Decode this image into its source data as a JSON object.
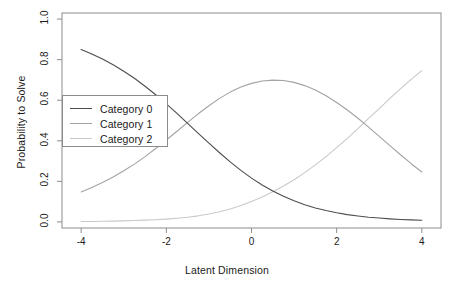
{
  "chart_data": {
    "type": "line",
    "title": "",
    "xlabel": "Latent Dimension",
    "ylabel": "Probability to Solve",
    "xlim": [
      -4.45,
      4.45
    ],
    "ylim": [
      -0.03,
      1.03
    ],
    "xticks": [
      "-4",
      "-2",
      "0",
      "2",
      "4"
    ],
    "xtick_values": [
      -4,
      -2,
      0,
      2,
      4
    ],
    "yticks": [
      "0.0",
      "0.2",
      "0.4",
      "0.6",
      "0.8",
      "1.0"
    ],
    "ytick_values": [
      0.0,
      0.2,
      0.4,
      0.6,
      0.8,
      1.0
    ],
    "grid": false,
    "legend_position": "center-left",
    "frame": true,
    "x": [
      -4.0,
      -3.75,
      -3.5,
      -3.25,
      -3.0,
      -2.75,
      -2.5,
      -2.25,
      -2.0,
      -1.75,
      -1.5,
      -1.25,
      -1.0,
      -0.75,
      -0.5,
      -0.25,
      0.0,
      0.25,
      0.5,
      0.75,
      1.0,
      1.25,
      1.5,
      1.75,
      2.0,
      2.25,
      2.5,
      2.75,
      3.0,
      3.25,
      3.5,
      3.75,
      4.0
    ],
    "series": [
      {
        "name": "Category 0",
        "color": "#4d4d4d",
        "values": [
          0.85,
          0.828,
          0.803,
          0.775,
          0.743,
          0.708,
          0.669,
          0.627,
          0.582,
          0.535,
          0.486,
          0.437,
          0.388,
          0.341,
          0.296,
          0.254,
          0.216,
          0.182,
          0.152,
          0.126,
          0.104,
          0.085,
          0.069,
          0.056,
          0.045,
          0.036,
          0.029,
          0.023,
          0.019,
          0.015,
          0.012,
          0.01,
          0.008
        ]
      },
      {
        "name": "Category 1",
        "color": "#a3a3a3",
        "values": [
          0.148,
          0.17,
          0.194,
          0.221,
          0.252,
          0.285,
          0.322,
          0.362,
          0.404,
          0.447,
          0.491,
          0.533,
          0.573,
          0.609,
          0.64,
          0.665,
          0.683,
          0.695,
          0.699,
          0.697,
          0.688,
          0.672,
          0.65,
          0.622,
          0.589,
          0.552,
          0.511,
          0.467,
          0.422,
          0.376,
          0.331,
          0.287,
          0.246
        ]
      },
      {
        "name": "Category 2",
        "color": "#c9c9c9",
        "values": [
          0.002,
          0.002,
          0.003,
          0.004,
          0.005,
          0.007,
          0.009,
          0.011,
          0.014,
          0.018,
          0.023,
          0.03,
          0.039,
          0.05,
          0.064,
          0.081,
          0.101,
          0.123,
          0.149,
          0.177,
          0.208,
          0.243,
          0.281,
          0.322,
          0.366,
          0.412,
          0.46,
          0.51,
          0.559,
          0.609,
          0.657,
          0.703,
          0.746
        ]
      }
    ]
  },
  "legend": {
    "entries": [
      {
        "label": "Category 0"
      },
      {
        "label": "Category 1"
      },
      {
        "label": "Category 2"
      }
    ]
  },
  "style": {
    "axis_color": "#8c8c8c",
    "text_color": "#1a1a1a",
    "background": "#ffffff"
  }
}
